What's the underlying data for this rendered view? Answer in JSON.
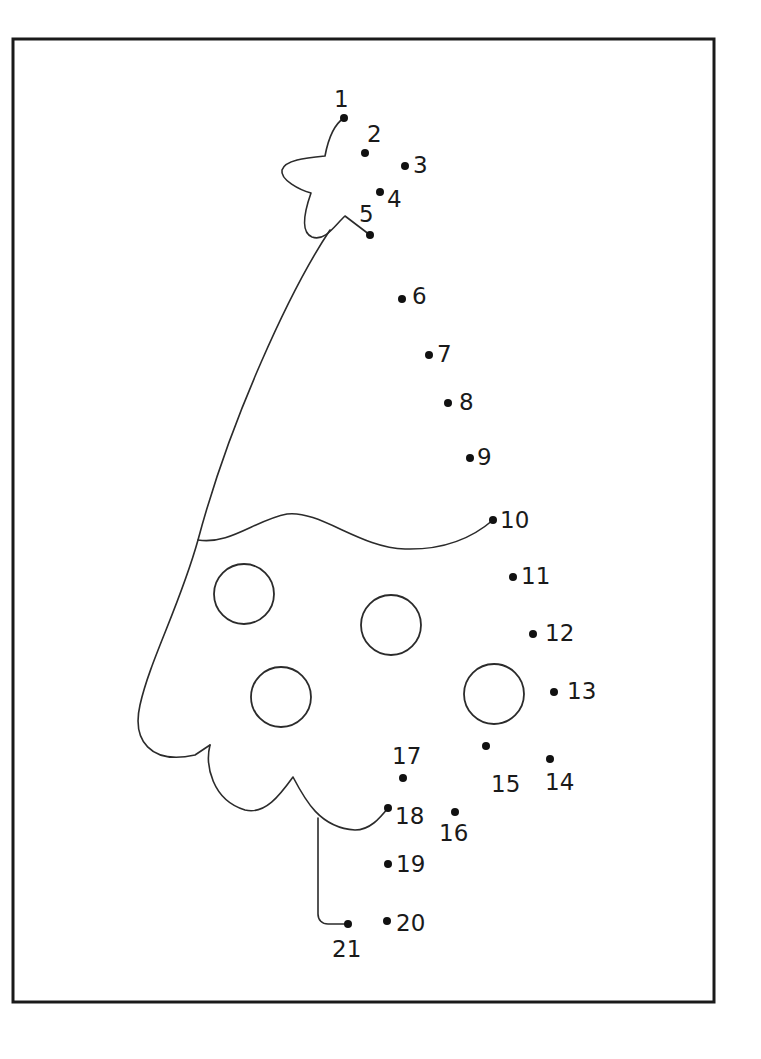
{
  "worksheet": {
    "type": "connect-the-dots",
    "subject": "christmas tree",
    "colors": {
      "ink": "#1a1a1a",
      "background": "#ffffff"
    },
    "frame": {
      "x": 13,
      "y": 39,
      "width": 701,
      "height": 963
    },
    "dots": [
      {
        "n": "1",
        "x": 344,
        "y": 118,
        "lx": 334,
        "ly": 107
      },
      {
        "n": "2",
        "x": 365,
        "y": 153,
        "lx": 367,
        "ly": 142
      },
      {
        "n": "3",
        "x": 405,
        "y": 166,
        "lx": 413,
        "ly": 173
      },
      {
        "n": "4",
        "x": 380,
        "y": 192,
        "lx": 387,
        "ly": 207
      },
      {
        "n": "5",
        "x": 370,
        "y": 235,
        "lx": 359,
        "ly": 222
      },
      {
        "n": "6",
        "x": 402,
        "y": 299,
        "lx": 412,
        "ly": 304
      },
      {
        "n": "7",
        "x": 429,
        "y": 355,
        "lx": 437,
        "ly": 362
      },
      {
        "n": "8",
        "x": 448,
        "y": 403,
        "lx": 459,
        "ly": 410
      },
      {
        "n": "9",
        "x": 470,
        "y": 458,
        "lx": 477,
        "ly": 465
      },
      {
        "n": "10",
        "x": 493,
        "y": 520,
        "lx": 500,
        "ly": 528
      },
      {
        "n": "11",
        "x": 513,
        "y": 577,
        "lx": 521,
        "ly": 584
      },
      {
        "n": "12",
        "x": 533,
        "y": 634,
        "lx": 545,
        "ly": 641
      },
      {
        "n": "13",
        "x": 554,
        "y": 692,
        "lx": 567,
        "ly": 699
      },
      {
        "n": "14",
        "x": 550,
        "y": 759,
        "lx": 545,
        "ly": 790
      },
      {
        "n": "15",
        "x": 486,
        "y": 746,
        "lx": 491,
        "ly": 792
      },
      {
        "n": "16",
        "x": 455,
        "y": 812,
        "lx": 439,
        "ly": 841
      },
      {
        "n": "17",
        "x": 403,
        "y": 778,
        "lx": 392,
        "ly": 764
      },
      {
        "n": "18",
        "x": 388,
        "y": 808,
        "lx": 395,
        "ly": 824
      },
      {
        "n": "19",
        "x": 388,
        "y": 864,
        "lx": 396,
        "ly": 872
      },
      {
        "n": "20",
        "x": 387,
        "y": 921,
        "lx": 396,
        "ly": 931
      },
      {
        "n": "21",
        "x": 348,
        "y": 924,
        "lx": 332,
        "ly": 957
      }
    ],
    "ornaments": [
      {
        "cx": 244,
        "cy": 594,
        "r": 30
      },
      {
        "cx": 391,
        "cy": 625,
        "r": 30
      },
      {
        "cx": 281,
        "cy": 697,
        "r": 30
      },
      {
        "cx": 494,
        "cy": 694,
        "r": 30
      }
    ],
    "outline_paths": {
      "star": "M344,118 C333,125 328,140 325,156 C305,158 285,160 282,170 C280,180 300,190 311,193 C305,210 300,232 312,237 C325,242 335,225 345,216 L370,235",
      "tree_left": "M330,230 C290,290 230,420 198,540 C180,605 150,660 140,705 C132,740 150,765 195,755 L210,745",
      "garland": "M198,540 C230,545 255,520 287,514 C320,510 360,548 405,549 C440,550 470,540 493,520",
      "tree_bottom": "M210,745 C205,765 212,800 245,810 C265,815 280,795 293,777 C305,800 320,828 355,830 C370,830 380,818 388,808",
      "trunk": "M318,818 L318,914 C318,920 322,924 328,924 L348,924"
    }
  }
}
